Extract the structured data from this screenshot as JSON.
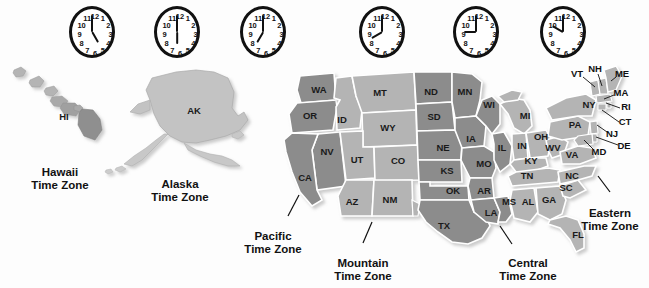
{
  "figure": {
    "background_color": "#fdfdfd"
  },
  "colors": {
    "hawaii_zone": "#b9b9b9",
    "alaska_zone": "#c3c3c3",
    "pacific_zone": "#8c8c8c",
    "mountain_zone": "#b4b4b4",
    "central_zone": "#8c8c8c",
    "eastern_zone": "#b4b4b4",
    "border": "#ffffff",
    "outline": "#6f6f6f",
    "text": "#111111",
    "clock_face": "#ffffff",
    "clock_rim": "#111111"
  },
  "clocks": [
    {
      "name": "hawaii-clock",
      "time": "5:00",
      "hour": 5,
      "minute": 0,
      "x": 92,
      "y": 32
    },
    {
      "name": "alaska-clock",
      "time": "6:00",
      "hour": 6,
      "minute": 0,
      "x": 177,
      "y": 32
    },
    {
      "name": "pacific-clock",
      "time": "7:00",
      "hour": 7,
      "minute": 0,
      "x": 263,
      "y": 32
    },
    {
      "name": "mountain-clock",
      "time": "8:00",
      "hour": 8,
      "minute": 0,
      "x": 382,
      "y": 32
    },
    {
      "name": "central-clock",
      "time": "9:00",
      "hour": 9,
      "minute": 0,
      "x": 476,
      "y": 32
    },
    {
      "name": "eastern-clock",
      "time": "10:00",
      "hour": 10,
      "minute": 0,
      "x": 563,
      "y": 32
    }
  ],
  "clock_numerals": [
    "12",
    "1",
    "2",
    "3",
    "4",
    "5",
    "6",
    "7",
    "8",
    "9",
    "10",
    "11"
  ],
  "zones": [
    {
      "id": "hawaii",
      "line1": "Hawaii",
      "line2": "Time Zone",
      "x": 60,
      "y": 166,
      "leader": false
    },
    {
      "id": "alaska",
      "line1": "Alaska",
      "line2": "Time Zone",
      "x": 180,
      "y": 178,
      "leader": false
    },
    {
      "id": "pacific",
      "line1": "Pacific",
      "line2": "Time Zone",
      "x": 273,
      "y": 230,
      "leader": true
    },
    {
      "id": "mountain",
      "line1": "Mountain",
      "line2": "Time Zone",
      "x": 363,
      "y": 257,
      "leader": true
    },
    {
      "id": "central",
      "line1": "Central",
      "line2": "Time Zone",
      "x": 528,
      "y": 257,
      "leader": true
    },
    {
      "id": "eastern",
      "line1": "Eastern",
      "line2": "Time Zone",
      "x": 610,
      "y": 207,
      "leader": true
    }
  ],
  "states": [
    {
      "abbr": "HI",
      "x": 64,
      "y": 117,
      "zone": "hawaii"
    },
    {
      "abbr": "AK",
      "x": 194,
      "y": 111,
      "zone": "alaska"
    },
    {
      "abbr": "WA",
      "x": 319,
      "y": 90,
      "zone": "pacific"
    },
    {
      "abbr": "OR",
      "x": 310,
      "y": 116,
      "zone": "pacific"
    },
    {
      "abbr": "CA",
      "x": 305,
      "y": 178,
      "zone": "pacific"
    },
    {
      "abbr": "NV",
      "x": 327,
      "y": 152,
      "zone": "pacific"
    },
    {
      "abbr": "ID",
      "x": 342,
      "y": 120,
      "zone": "mountain"
    },
    {
      "abbr": "MT",
      "x": 380,
      "y": 93,
      "zone": "mountain"
    },
    {
      "abbr": "WY",
      "x": 388,
      "y": 128,
      "zone": "mountain"
    },
    {
      "abbr": "UT",
      "x": 357,
      "y": 160,
      "zone": "mountain"
    },
    {
      "abbr": "CO",
      "x": 398,
      "y": 161,
      "zone": "mountain"
    },
    {
      "abbr": "AZ",
      "x": 352,
      "y": 202,
      "zone": "mountain"
    },
    {
      "abbr": "NM",
      "x": 390,
      "y": 200,
      "zone": "mountain"
    },
    {
      "abbr": "ND",
      "x": 431,
      "y": 92,
      "zone": "central"
    },
    {
      "abbr": "SD",
      "x": 434,
      "y": 117,
      "zone": "central"
    },
    {
      "abbr": "NE",
      "x": 443,
      "y": 148,
      "zone": "central"
    },
    {
      "abbr": "KS",
      "x": 447,
      "y": 171,
      "zone": "central"
    },
    {
      "abbr": "OK",
      "x": 453,
      "y": 191,
      "zone": "central"
    },
    {
      "abbr": "TX",
      "x": 444,
      "y": 226,
      "zone": "central"
    },
    {
      "abbr": "MN",
      "x": 465,
      "y": 92,
      "zone": "central"
    },
    {
      "abbr": "IA",
      "x": 471,
      "y": 139,
      "zone": "central"
    },
    {
      "abbr": "MO",
      "x": 484,
      "y": 164,
      "zone": "central"
    },
    {
      "abbr": "AR",
      "x": 484,
      "y": 191,
      "zone": "central"
    },
    {
      "abbr": "LA",
      "x": 491,
      "y": 213,
      "zone": "central"
    },
    {
      "abbr": "MS",
      "x": 509,
      "y": 202,
      "zone": "central"
    },
    {
      "abbr": "WI",
      "x": 489,
      "y": 105,
      "zone": "central"
    },
    {
      "abbr": "IL",
      "x": 502,
      "y": 148,
      "zone": "central"
    },
    {
      "abbr": "MI",
      "x": 525,
      "y": 116,
      "zone": "eastern"
    },
    {
      "abbr": "IN",
      "x": 522,
      "y": 146,
      "zone": "eastern"
    },
    {
      "abbr": "OH",
      "x": 541,
      "y": 137,
      "zone": "eastern"
    },
    {
      "abbr": "KY",
      "x": 531,
      "y": 161,
      "zone": "eastern"
    },
    {
      "abbr": "TN",
      "x": 527,
      "y": 176,
      "zone": "eastern"
    },
    {
      "abbr": "AL",
      "x": 528,
      "y": 202,
      "zone": "eastern"
    },
    {
      "abbr": "GA",
      "x": 549,
      "y": 200,
      "zone": "eastern"
    },
    {
      "abbr": "FL",
      "x": 578,
      "y": 235,
      "zone": "eastern"
    },
    {
      "abbr": "SC",
      "x": 566,
      "y": 188,
      "zone": "eastern"
    },
    {
      "abbr": "NC",
      "x": 572,
      "y": 176,
      "zone": "eastern"
    },
    {
      "abbr": "WV",
      "x": 553,
      "y": 148,
      "zone": "eastern"
    },
    {
      "abbr": "VA",
      "x": 572,
      "y": 155,
      "zone": "eastern"
    },
    {
      "abbr": "PA",
      "x": 575,
      "y": 125,
      "zone": "eastern"
    },
    {
      "abbr": "NY",
      "x": 589,
      "y": 105,
      "zone": "eastern"
    }
  ],
  "callout_states": [
    {
      "abbr": "VT",
      "x": 577,
      "y": 74,
      "tip_x": 594,
      "tip_y": 86,
      "zone": "eastern"
    },
    {
      "abbr": "NH",
      "x": 595,
      "y": 69,
      "tip_x": 601,
      "tip_y": 85,
      "zone": "eastern"
    },
    {
      "abbr": "ME",
      "x": 622,
      "y": 74,
      "tip_x": 610,
      "tip_y": 80,
      "zone": "eastern"
    },
    {
      "abbr": "MA",
      "x": 621,
      "y": 93,
      "tip_x": 604,
      "tip_y": 98,
      "zone": "eastern"
    },
    {
      "abbr": "RI",
      "x": 626,
      "y": 107,
      "tip_x": 605,
      "tip_y": 103,
      "zone": "eastern"
    },
    {
      "abbr": "CT",
      "x": 625,
      "y": 122,
      "tip_x": 601,
      "tip_y": 110,
      "zone": "eastern"
    },
    {
      "abbr": "NJ",
      "x": 612,
      "y": 134,
      "tip_x": 596,
      "tip_y": 124,
      "zone": "eastern"
    },
    {
      "abbr": "DE",
      "x": 624,
      "y": 146,
      "tip_x": 594,
      "tip_y": 135,
      "zone": "eastern"
    },
    {
      "abbr": "MD",
      "x": 599,
      "y": 152,
      "tip_x": 585,
      "tip_y": 139,
      "zone": "eastern"
    }
  ]
}
